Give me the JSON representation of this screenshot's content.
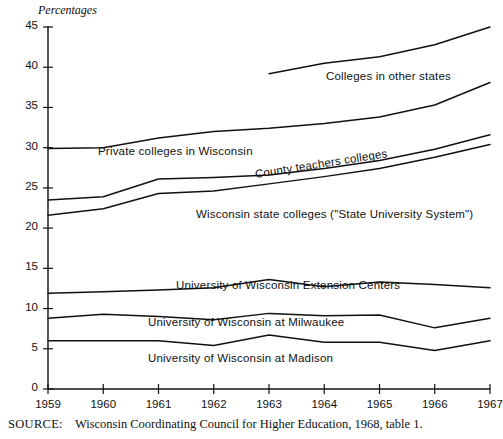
{
  "chart_data": {
    "type": "line",
    "title": "",
    "ylabel": "Percentages",
    "xlabel": "",
    "ylim": [
      0,
      45
    ],
    "ytick_values": [
      0,
      5,
      10,
      15,
      20,
      25,
      30,
      35,
      40,
      45
    ],
    "ytick_labels": [
      "0",
      "5",
      "10",
      "15",
      "20",
      "25",
      "30",
      "35",
      "40",
      "45"
    ],
    "x": [
      1959,
      1960,
      1961,
      1962,
      1963,
      1964,
      1965,
      1966,
      1967
    ],
    "xtick_labels": [
      "1959",
      "1960",
      "1961",
      "1962",
      "1963",
      "1964",
      "1965",
      "1966",
      "1967"
    ],
    "grid": false,
    "legend": "inline-labels",
    "series": [
      {
        "name": "Colleges in other states",
        "label": "Colleges in other states",
        "x": [
          1963,
          1964,
          1965,
          1966,
          1967
        ],
        "values": [
          39.2,
          40.5,
          41.3,
          42.8,
          45.0
        ]
      },
      {
        "name": "Private colleges in Wisconsin",
        "label": "Private colleges in Wisconsin",
        "x": [
          1959,
          1960,
          1961,
          1962,
          1963,
          1964,
          1965,
          1966,
          1967
        ],
        "values": [
          29.9,
          30.0,
          31.2,
          32.0,
          32.4,
          33.0,
          33.8,
          35.3,
          38.1
        ]
      },
      {
        "name": "County teachers colleges",
        "label": "County teachers colleges",
        "x": [
          1959,
          1960,
          1961,
          1962,
          1963,
          1964,
          1965,
          1966,
          1967
        ],
        "values": [
          23.5,
          23.9,
          26.1,
          26.3,
          26.6,
          27.4,
          28.4,
          29.8,
          31.6
        ]
      },
      {
        "name": "Wisconsin state colleges (\"State University System\")",
        "label": "Wisconsin state colleges (\"State University System\")",
        "x": [
          1959,
          1960,
          1961,
          1962,
          1963,
          1964,
          1965,
          1966,
          1967
        ],
        "values": [
          21.6,
          22.4,
          24.3,
          24.6,
          25.5,
          26.4,
          27.4,
          28.8,
          30.4
        ]
      },
      {
        "name": "University of Wisconsin Extension Centers",
        "label": "University of Wisconsin Extension Centers",
        "x": [
          1959,
          1960,
          1961,
          1962,
          1963,
          1964,
          1965,
          1966,
          1967
        ],
        "values": [
          11.9,
          12.1,
          12.3,
          12.6,
          13.6,
          12.7,
          13.3,
          13.0,
          12.6
        ]
      },
      {
        "name": "University of Wisconsin at Milwaukee",
        "label": "University of Wisconsin at Milwaukee",
        "x": [
          1959,
          1960,
          1961,
          1962,
          1963,
          1964,
          1965,
          1966,
          1967
        ],
        "values": [
          8.8,
          9.3,
          9.0,
          8.6,
          9.4,
          9.1,
          9.2,
          7.6,
          8.8
        ]
      },
      {
        "name": "University of Wisconsin at Madison",
        "label": "University of Wisconsin at Madison",
        "x": [
          1959,
          1960,
          1961,
          1962,
          1963,
          1964,
          1965,
          1966,
          1967
        ],
        "values": [
          6.0,
          6.0,
          6.0,
          5.4,
          6.7,
          5.8,
          5.8,
          4.8,
          6.0
        ]
      }
    ],
    "annotations": {
      "private_colleges_label": "Private colleges in Wisconsin",
      "county_teachers_label": "County teachers colleges",
      "state_colleges_label": "Wisconsin state colleges (\"State University System\")",
      "extension_centers_label": "University of Wisconsin Extension Centers",
      "milwaukee_label": "University of Wisconsin at Milwaukee",
      "madison_label": "University of Wisconsin at Madison",
      "other_states_label": "Colleges in other states"
    },
    "source": {
      "key": "SOURCE:",
      "text": "Wisconsin Coordinating Council for Higher Education, 1968, table 1."
    },
    "colors": {
      "line": "#111111",
      "axis": "#111111",
      "background": "#ffffff",
      "text": "#111111"
    }
  }
}
